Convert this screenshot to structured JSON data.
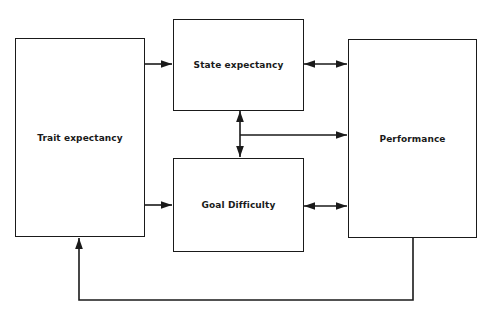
{
  "diagram": {
    "nodes": [
      {
        "id": "trait",
        "label": "Trait expectancy"
      },
      {
        "id": "state",
        "label": "State expectancy"
      },
      {
        "id": "goal",
        "label": "Goal Difficulty"
      },
      {
        "id": "performance",
        "label": "Performance"
      }
    ],
    "edges": [
      {
        "from": "trait",
        "to": "state",
        "type": "directed"
      },
      {
        "from": "trait",
        "to": "goal",
        "type": "directed"
      },
      {
        "from": "state",
        "to": "performance",
        "type": "bidirectional"
      },
      {
        "from": "goal",
        "to": "performance",
        "type": "bidirectional"
      },
      {
        "from": "state",
        "to": "goal",
        "type": "bidirectional"
      },
      {
        "from": "state-goal-link",
        "to": "performance",
        "type": "directed"
      },
      {
        "from": "performance",
        "to": "trait",
        "type": "directed",
        "note": "feedback loop"
      }
    ],
    "colors": {
      "stroke": "#1a1a1a",
      "background": "#ffffff"
    }
  }
}
